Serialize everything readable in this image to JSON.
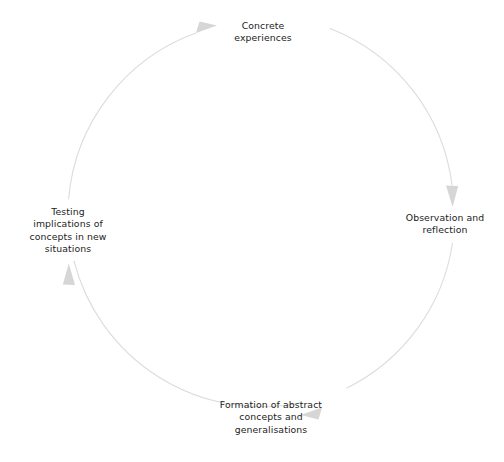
{
  "diagram": {
    "type": "cyclical-process",
    "direction": "clockwise",
    "background_color": "#ffffff",
    "arc": {
      "stroke_color": "#dcdcdc",
      "stroke_width": 1.1,
      "center_x": 262,
      "center_y": 212,
      "radius": 194
    },
    "label_color": "#1c1c1c",
    "arrowhead_color": "#d4d4d4",
    "nodes": [
      {
        "id": "concrete-experiences",
        "label": "Concrete\nexperiences",
        "position": "top",
        "order": 1
      },
      {
        "id": "observation-reflection",
        "label": "Observation and\nreflection",
        "position": "right",
        "order": 2
      },
      {
        "id": "formation-abstract-concepts",
        "label": "Formation of abstract\nconcepts and\ngeneralisations",
        "position": "bottom",
        "order": 3
      },
      {
        "id": "testing-implications",
        "label": "Testing\nimplications of\nconcepts in new\nsituations",
        "position": "left",
        "order": 4
      }
    ],
    "arrows": [
      {
        "id": "arrow-top",
        "points_to": "concrete-experiences",
        "direction": "right"
      },
      {
        "id": "arrow-right",
        "points_to": "observation-reflection",
        "direction": "down"
      },
      {
        "id": "arrow-bottom",
        "points_to": "formation-abstract-concepts",
        "direction": "left"
      },
      {
        "id": "arrow-left",
        "points_to": "testing-implications",
        "direction": "up"
      }
    ],
    "footer_artifact": ""
  }
}
